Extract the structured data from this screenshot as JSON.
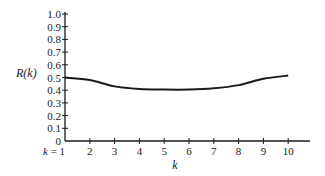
{
  "chart_data": {
    "type": "line",
    "title": "",
    "xlabel": "k",
    "ylabel": "R(k)",
    "x": [
      1,
      2,
      3,
      4,
      5,
      6,
      7,
      8,
      9,
      10
    ],
    "x_tick_labels": [
      "k = 1",
      "2",
      "3",
      "4",
      "5",
      "6",
      "7",
      "8",
      "9",
      "10"
    ],
    "y_ticks": [
      0,
      0.1,
      0.2,
      0.3,
      0.4,
      0.5,
      0.6,
      0.7,
      0.8,
      0.9,
      1.0
    ],
    "y_tick_labels": [
      "0",
      "0.1",
      "0.2",
      "0.3",
      "0.4",
      "0.5",
      "0.6",
      "0.7",
      "0.8",
      "0.9",
      "1.0"
    ],
    "series": [
      {
        "name": "R(k)",
        "values": [
          0.5,
          0.48,
          0.43,
          0.41,
          0.405,
          0.405,
          0.415,
          0.44,
          0.49,
          0.515
        ]
      }
    ],
    "ylim": [
      0,
      1.0
    ],
    "xlim": [
      1,
      10.9
    ],
    "grid": false,
    "legend": "none",
    "line_color": "#1a1a1a"
  }
}
